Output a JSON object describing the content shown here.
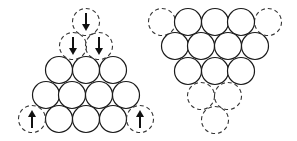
{
  "diagram": {
    "colors": {
      "outline": "#1a1a1a",
      "dashed": "#333333",
      "arrow": "#111111",
      "background": "#ffffff"
    },
    "left_figure": {
      "name": "upright-triangle-stack",
      "solid_rows": [
        3,
        4,
        3
      ],
      "dashed_circles": [
        {
          "id": "top",
          "arrow": "down"
        },
        {
          "id": "second-left",
          "arrow": "down"
        },
        {
          "id": "second-right",
          "arrow": "down"
        },
        {
          "id": "bottom-left",
          "arrow": "up"
        },
        {
          "id": "bottom-right",
          "arrow": "up"
        }
      ]
    },
    "right_figure": {
      "name": "inverted-triangle-stack",
      "solid_rows": [
        3,
        4,
        3
      ],
      "dashed_circles": [
        {
          "id": "top-left",
          "arrow": "none"
        },
        {
          "id": "top-right",
          "arrow": "none"
        },
        {
          "id": "lower-left",
          "arrow": "none"
        },
        {
          "id": "lower-right",
          "arrow": "none"
        },
        {
          "id": "bottom",
          "arrow": "none"
        }
      ]
    }
  }
}
